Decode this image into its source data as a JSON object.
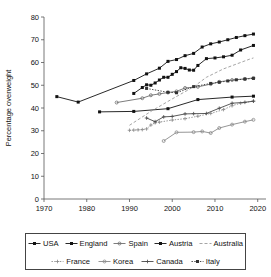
{
  "chart_data": {
    "type": "line",
    "title": "",
    "xlabel": "Year",
    "ylabel": "Percentage overweight",
    "xlim": [
      1970,
      2021
    ],
    "ylim": [
      0,
      80
    ],
    "xticks": [
      1970,
      1980,
      1990,
      2000,
      2010,
      2020
    ],
    "yticks": [
      0,
      10,
      20,
      30,
      40,
      50,
      60,
      70,
      80
    ],
    "grid": false,
    "legend_position": "bottom",
    "legend_rows": [
      [
        "USA",
        "England",
        "Spain",
        "Austria",
        "Australia"
      ],
      [
        "France",
        "Korea",
        "Canada",
        "Italy"
      ]
    ],
    "series": [
      {
        "name": "USA",
        "color": "#111111",
        "marker": "square",
        "dash": "solid",
        "x": [
          1973,
          1978,
          1991,
          1994,
          1997,
          1999,
          2001,
          2003,
          2005,
          2007,
          2009,
          2011,
          2013,
          2015,
          2017,
          2019
        ],
        "y": [
          45.0,
          42.6,
          52.1,
          55.0,
          57.5,
          60.5,
          61.3,
          63.0,
          64.0,
          66.8,
          68.2,
          69.0,
          70.0,
          71.0,
          71.8,
          72.5
        ]
      },
      {
        "name": "England",
        "color": "#111111",
        "marker": "square",
        "dash": "solid",
        "x": [
          1991,
          1993,
          1994,
          1995,
          1996,
          1997,
          1998,
          1999,
          2000,
          2001,
          2002,
          2003,
          2004,
          2005,
          2006,
          2008,
          2010,
          2012,
          2014,
          2016,
          2019
        ],
        "y": [
          46.4,
          49.0,
          50.2,
          50.0,
          51.0,
          52.3,
          53.5,
          53.5,
          54.8,
          56.0,
          57.7,
          57.4,
          56.7,
          56.6,
          58.7,
          61.7,
          62.0,
          62.5,
          63.2,
          65.5,
          67.5
        ]
      },
      {
        "name": "Spain",
        "color": "#6e6e6e",
        "marker": "circle",
        "dash": "solid",
        "x": [
          1987,
          1993,
          1995,
          1997,
          1999,
          2001,
          2003,
          2006,
          2009,
          2011,
          2014,
          2017,
          2019
        ],
        "y": [
          42.4,
          44.3,
          45.6,
          46.2,
          46.8,
          47.3,
          48.8,
          49.3,
          50.5,
          51.5,
          52.3,
          52.8,
          53.2
        ]
      },
      {
        "name": "Austria",
        "color": "#111111",
        "marker": "square",
        "dash": "solid",
        "x": [
          1983,
          1991,
          1999,
          2006,
          2014,
          2019
        ],
        "y": [
          38.3,
          38.5,
          39.7,
          43.7,
          44.8,
          45.2
        ]
      },
      {
        "name": "Australia",
        "color": "#9b9b9b",
        "marker": "none",
        "dash": "dashed",
        "x": [
          1990,
          1995,
          2000,
          2005,
          2008,
          2012,
          2015,
          2018,
          2019
        ],
        "y": [
          32.4,
          38.5,
          44.0,
          49.3,
          53.5,
          57.2,
          59.3,
          61.4,
          62.0
        ]
      },
      {
        "name": "France",
        "color": "#8a8a8a",
        "marker": "plus",
        "dash": "dotted",
        "x": [
          1990,
          1991,
          1992,
          1993,
          1994,
          1995,
          1996,
          1997,
          2000,
          2003,
          2006,
          2009,
          2012,
          2014,
          2016,
          2019
        ],
        "y": [
          30.2,
          30.3,
          30.4,
          30.5,
          30.8,
          32.5,
          33.5,
          33.8,
          34.7,
          35.3,
          36.4,
          37.6,
          39.3,
          41.0,
          42.1,
          43.0
        ]
      },
      {
        "name": "Korea",
        "color": "#8a8a8a",
        "marker": "circle",
        "dash": "solid",
        "x": [
          1998,
          2001,
          2005,
          2007,
          2009,
          2011,
          2014,
          2017,
          2019
        ],
        "y": [
          25.5,
          29.3,
          29.4,
          29.7,
          29.0,
          31.2,
          32.7,
          34.0,
          34.8
        ]
      },
      {
        "name": "Canada",
        "color": "#4a4a4a",
        "marker": "plus",
        "dash": "solid",
        "x": [
          1994,
          1996,
          1998,
          2000,
          2003,
          2005,
          2008,
          2011,
          2014,
          2017,
          2019
        ],
        "y": [
          35.6,
          34.0,
          36.1,
          36.3,
          37.4,
          37.5,
          37.6,
          39.9,
          42.1,
          42.5,
          43.0
        ]
      },
      {
        "name": "Italy",
        "color": "#333333",
        "marker": "square",
        "dash": "dotted",
        "x": [
          1994,
          1999,
          2001,
          2005,
          2009,
          2011,
          2013,
          2015,
          2017,
          2019
        ],
        "y": [
          48.6,
          46.9,
          46.7,
          49.4,
          50.8,
          51.3,
          51.9,
          52.4,
          52.7,
          53.0
        ]
      }
    ]
  }
}
